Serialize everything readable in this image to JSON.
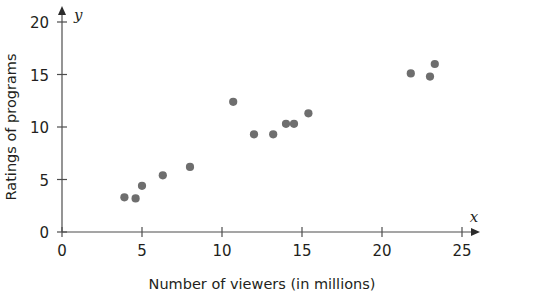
{
  "chart_data": {
    "type": "scatter",
    "title": "",
    "xlabel": "Number of viewers (in millions)",
    "ylabel": "Ratings of programs",
    "x_axis_variable": "x",
    "y_axis_variable": "y",
    "xlim": [
      0,
      25
    ],
    "ylim": [
      0,
      20
    ],
    "x_ticks": [
      0,
      5,
      10,
      15,
      20,
      25
    ],
    "y_ticks": [
      0,
      5,
      10,
      15,
      20
    ],
    "grid": false,
    "legend": false,
    "marker_color": "#6e6e6e",
    "axis_color": "#4d4d4d",
    "points": [
      {
        "x": 3.9,
        "y": 3.3
      },
      {
        "x": 4.6,
        "y": 3.2
      },
      {
        "x": 5.0,
        "y": 4.4
      },
      {
        "x": 6.3,
        "y": 5.4
      },
      {
        "x": 8.0,
        "y": 6.2
      },
      {
        "x": 10.7,
        "y": 12.4
      },
      {
        "x": 12.0,
        "y": 9.3
      },
      {
        "x": 13.2,
        "y": 9.3
      },
      {
        "x": 14.0,
        "y": 10.3
      },
      {
        "x": 14.5,
        "y": 10.3
      },
      {
        "x": 15.4,
        "y": 11.3
      },
      {
        "x": 21.8,
        "y": 15.1
      },
      {
        "x": 23.0,
        "y": 14.8
      },
      {
        "x": 23.3,
        "y": 16.0
      }
    ]
  },
  "labels": {
    "x_title": "Number of viewers (in millions)",
    "y_title": "Ratings of programs",
    "x_var": "x",
    "y_var": "y",
    "x_tick_0": "0",
    "x_tick_1": "5",
    "x_tick_2": "10",
    "x_tick_3": "15",
    "x_tick_4": "20",
    "x_tick_5": "25",
    "y_tick_0": "0",
    "y_tick_1": "5",
    "y_tick_2": "10",
    "y_tick_3": "15",
    "y_tick_4": "20"
  }
}
